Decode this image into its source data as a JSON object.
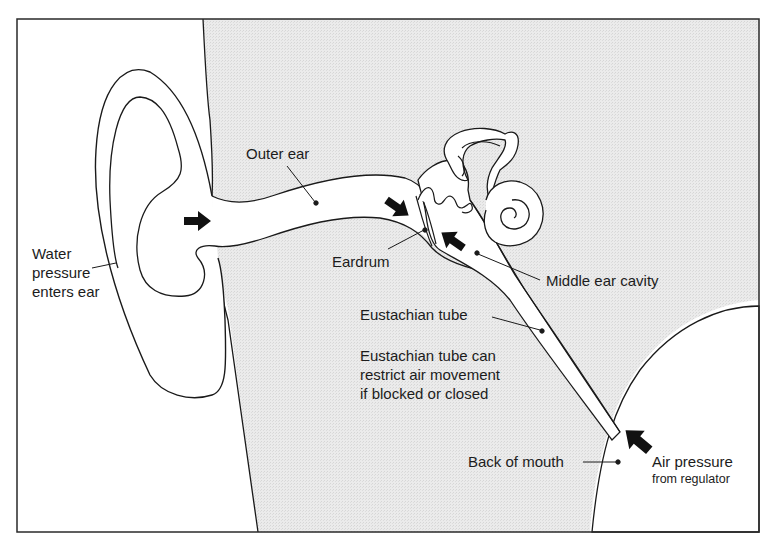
{
  "figure": {
    "colors": {
      "background": "#ffffff",
      "head_fill": "#e9e9e9",
      "line": "#1a1a1a",
      "text": "#1c1c1c"
    },
    "labels": {
      "outer_ear": "Outer ear",
      "eardrum": "Eardrum",
      "middle_ear_cavity": "Middle ear cavity",
      "eustachian_tube": "Eustachian tube",
      "eustachian_note": [
        "Eustachian tube can",
        "restrict air movement",
        "if blocked or closed"
      ],
      "water_pressure": [
        "Water",
        "pressure",
        "enters ear"
      ],
      "back_of_mouth": "Back of mouth",
      "air_pressure": "Air pressure",
      "air_pressure_sub": "from regulator"
    },
    "arrows": [
      {
        "name": "water-pressure-arrow-outer",
        "direction": "right"
      },
      {
        "name": "water-pressure-arrow-eardrum",
        "direction": "down-right"
      },
      {
        "name": "air-pressure-arrow-middle-ear",
        "direction": "up-left"
      },
      {
        "name": "air-pressure-arrow-mouth",
        "direction": "up-left"
      }
    ]
  }
}
